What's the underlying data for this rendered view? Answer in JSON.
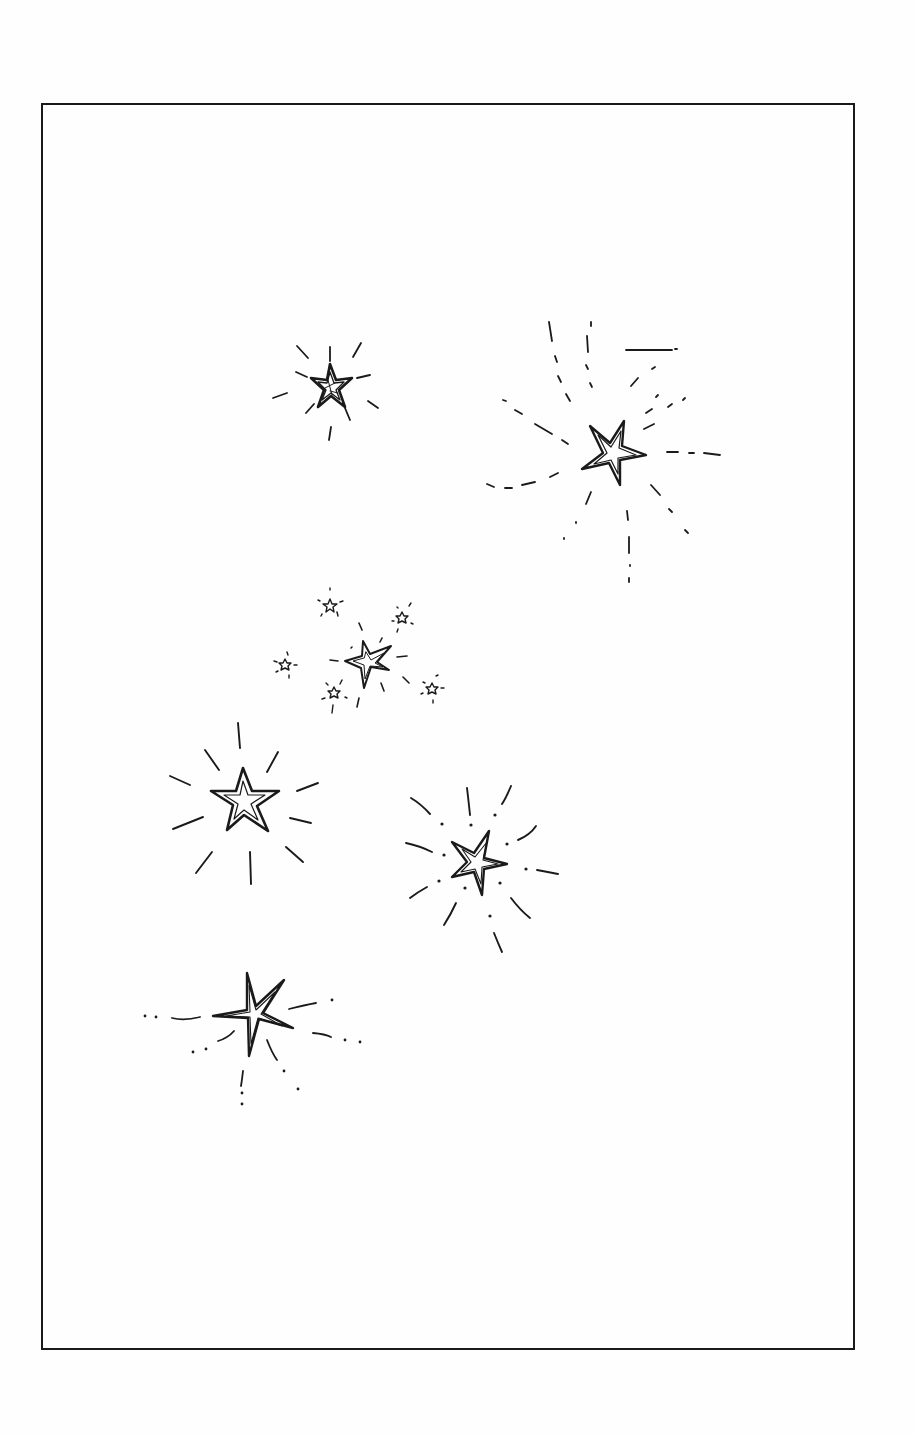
{
  "page": {
    "title": "Star clusters line illustration",
    "background": "#fefefe",
    "ink_color": "#1a1a1a"
  },
  "frame": {
    "x": 41,
    "y": 103,
    "width": 812,
    "height": 1245,
    "stroke_width": 2
  },
  "stars": [
    {
      "id": "star-top-left",
      "cx": 330,
      "cy": 385,
      "r": 32,
      "style": "shaded",
      "rays": "solid-short"
    },
    {
      "id": "star-top-right",
      "cx": 614,
      "cy": 455,
      "r": 38,
      "style": "shaded",
      "rays": "dashed-curved-long"
    },
    {
      "id": "star-cluster-center",
      "cx": 372,
      "cy": 660,
      "r": 26,
      "style": "outline-inner",
      "rays": "solid-short"
    },
    {
      "id": "star-cluster-small-1",
      "cx": 330,
      "cy": 605,
      "r": 8,
      "style": "tiny",
      "rays": "tiny-ticks"
    },
    {
      "id": "star-cluster-small-2",
      "cx": 402,
      "cy": 618,
      "r": 7,
      "style": "tiny",
      "rays": "tiny-ticks"
    },
    {
      "id": "star-cluster-small-3",
      "cx": 285,
      "cy": 665,
      "r": 7,
      "style": "tiny",
      "rays": "tiny-ticks"
    },
    {
      "id": "star-cluster-small-4",
      "cx": 334,
      "cy": 693,
      "r": 7,
      "style": "tiny",
      "rays": "tiny-ticks"
    },
    {
      "id": "star-cluster-small-5",
      "cx": 432,
      "cy": 688,
      "r": 7,
      "style": "tiny",
      "rays": "tiny-ticks"
    },
    {
      "id": "star-middle-left",
      "cx": 244,
      "cy": 800,
      "r": 36,
      "style": "shaded",
      "rays": "solid-long"
    },
    {
      "id": "star-middle-right",
      "cx": 478,
      "cy": 860,
      "r": 36,
      "style": "shaded",
      "rays": "solid-curved-dotted"
    },
    {
      "id": "star-bottom-left",
      "cx": 254,
      "cy": 1012,
      "r": 44,
      "style": "four-point-sparkle",
      "rays": "dashed-dotted"
    }
  ]
}
